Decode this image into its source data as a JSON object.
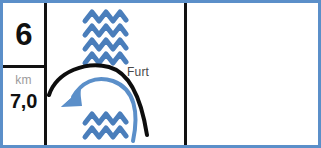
{
  "frame": {
    "width": 321,
    "height": 148,
    "border_color": "#5b8fc9",
    "background_color": "#ffffff",
    "rule_color": "#111111"
  },
  "left_column": {
    "step_number": "6",
    "distance_unit": "km",
    "distance_value": "7,0"
  },
  "pictogram": {
    "label": "Furt",
    "label_color": "#4a4a4a",
    "water_color": "#4a7ebb",
    "road_color": "#0d0d0d",
    "icons": {
      "waves_upstream": "water-waves-icon",
      "waves_downstream": "water-waves-icon",
      "road_arc": "road-arc-icon",
      "flow_arrow": "river-flow-arrow-icon"
    },
    "wave_rows_upstream": 4,
    "wave_rows_downstream": 2
  },
  "right_panel": {
    "content": ""
  }
}
